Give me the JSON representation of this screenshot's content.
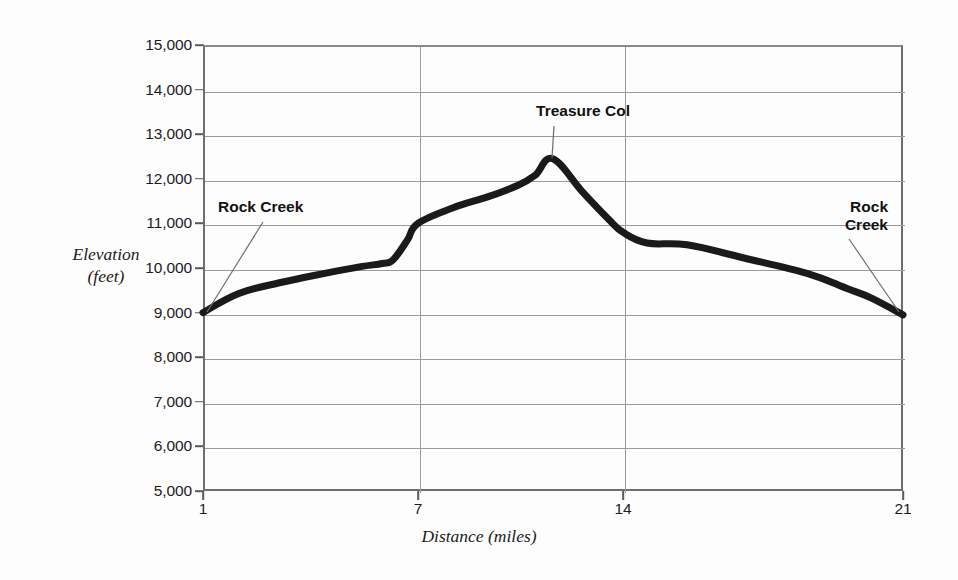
{
  "chart_data": {
    "type": "line",
    "title": "",
    "xlabel": "Distance (miles)",
    "ylabel": "Elevation\n(feet)",
    "ylabel_line1": "Elevation",
    "ylabel_line2": "(feet)",
    "xlim": [
      1,
      21
    ],
    "ylim": [
      5000,
      15000
    ],
    "grid": true,
    "legend": "none",
    "x_tick_labels": [
      "1",
      "7",
      "14",
      "21"
    ],
    "x_tick_values": [
      1,
      7,
      14,
      21
    ],
    "y_tick_labels": [
      "15,000",
      "14,000",
      "13,000",
      "12,000",
      "11,000",
      "10,000",
      "9,000",
      "8,000",
      "7,000",
      "6,000",
      "5,000"
    ],
    "y_tick_values": [
      15000,
      14000,
      13000,
      12000,
      11000,
      10000,
      9000,
      8000,
      7000,
      6000,
      5000
    ],
    "series": [
      {
        "name": "Trail elevation profile",
        "color": "#1a1a1a",
        "line_width": 7,
        "x": [
          1.0,
          2.0,
          3.2,
          4.4,
          5.4,
          6.0,
          6.3,
          6.7,
          7.0,
          8.2,
          9.4,
          10.4,
          11.0,
          11.6,
          12.6,
          13.5,
          14.0,
          14.6,
          15.6,
          17.0,
          18.6,
          19.6,
          20.2,
          21.0
        ],
        "y": [
          9000,
          9430,
          9680,
          9880,
          10030,
          10100,
          10180,
          10620,
          11000,
          11350,
          11600,
          11850,
          12080,
          12450,
          11720,
          11100,
          10800,
          10560,
          10520,
          10230,
          9880,
          9540,
          9330,
          8950
        ]
      }
    ],
    "annotations": [
      {
        "id": "rock-creek-left",
        "text": "Rock Creek",
        "align": "left",
        "label_x": 218,
        "label_y": 198,
        "leader_from_x": 263,
        "leader_from_y": 222,
        "leader_to_x": 207,
        "leader_to_y": 312
      },
      {
        "id": "treasure-col",
        "text": "Treasure Col",
        "align": "center",
        "label_x": 498,
        "label_y": 102,
        "leader_from_x": 554,
        "leader_from_y": 126,
        "leader_to_x": 552,
        "leader_to_y": 158
      },
      {
        "id": "rock-creek-right",
        "text": "Rock\nCreek",
        "align": "right",
        "label_x": 796,
        "label_y": 198,
        "leader_from_x": 849,
        "leader_from_y": 239,
        "leader_to_x": 899,
        "leader_to_y": 312
      }
    ],
    "axis_color": "#6e6e6e",
    "grid_color": "#9a9a9a",
    "background_color": "#fdfdfd"
  }
}
